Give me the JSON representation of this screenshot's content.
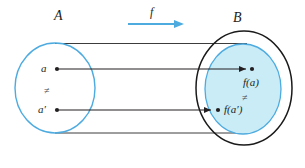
{
  "figure": {
    "kind": "injective-function-venn-diagram",
    "colors": {
      "set_a_outline": "#4dabe0",
      "set_b_outline": "#1a1a1a",
      "image_fill": "#c9ecf7",
      "image_outline": "#4dabe0",
      "arrow_blue": "#4dabe0",
      "arrow_dark": "#231f20",
      "label_text": "#231f20",
      "background": "#ffffff"
    },
    "labels": {
      "set_a": "A",
      "set_b": "B",
      "function": "f",
      "domain_element_1": "a",
      "domain_element_2": "a′",
      "image_element_1": "f(a)",
      "image_element_2": "f(a′)",
      "not_equal_domain": "≠",
      "not_equal_codomain": "≠"
    },
    "map_arrows": [
      {
        "from": "a",
        "to": "f(a)"
      },
      {
        "from": "a′",
        "to": "f(a′)"
      }
    ],
    "function_arrow": {
      "label": "f",
      "direction": "left-to-right"
    }
  }
}
